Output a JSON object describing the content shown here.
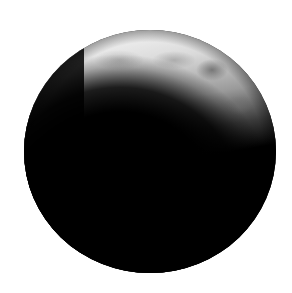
{
  "image": {
    "subject": "Crescent moon",
    "description": "Dark lunar disk with a thin illuminated crescent along the upper-right limb against a white background",
    "colors": {
      "background": "#ffffff",
      "disk": "#000000",
      "lit_surface": "#d8d8d8",
      "lit_highlight": "#eeeeee",
      "maria": "#8a8a8a"
    }
  }
}
